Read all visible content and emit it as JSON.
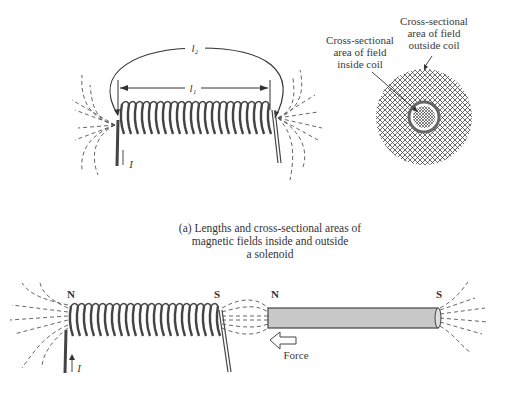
{
  "figure": {
    "part_a": {
      "length_labels": {
        "outer": "l2",
        "outer_display": "l₂",
        "inner": "l1",
        "inner_display": "l₁"
      },
      "current_label": "I",
      "cross_section": {
        "label_inside": [
          "Cross-sectional",
          "area of field",
          "inside coil"
        ],
        "label_outside": [
          "Cross-sectional",
          "area of field",
          "outside coil"
        ]
      },
      "caption": [
        "(a) Lengths and cross-sectional areas of",
        "magnetic fields inside and outside",
        "a solenoid"
      ]
    },
    "part_b": {
      "solenoid_poles": {
        "left": "N",
        "right": "S"
      },
      "magnet_poles": {
        "left": "N",
        "right": "S"
      },
      "current_label": "I",
      "force_label": "Force"
    }
  },
  "colors": {
    "ink": "#3a3a3a",
    "magnet_fill": "#c8c8c8",
    "background": "#ffffff"
  }
}
